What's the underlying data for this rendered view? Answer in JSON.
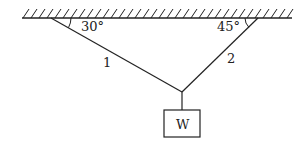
{
  "diagram": {
    "angle_left": "30°",
    "angle_right": "45°",
    "cable_1_label": "1",
    "cable_2_label": "2",
    "weight_label": "W"
  }
}
